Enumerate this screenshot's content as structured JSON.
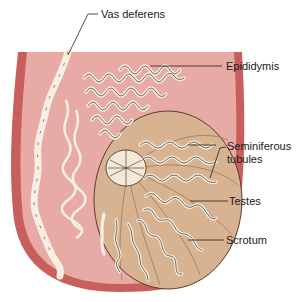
{
  "diagram": {
    "labels": [
      {
        "id": "vas_deferens",
        "text": "Vas deferens"
      },
      {
        "id": "epididymis",
        "text": "Epididymis"
      },
      {
        "id": "seminiferous_line1",
        "text": "Seminiferous"
      },
      {
        "id": "seminiferous_line2",
        "text": "tubules"
      },
      {
        "id": "testes",
        "text": "Testes"
      },
      {
        "id": "scrotum",
        "text": "Scrotum"
      }
    ],
    "colors": {
      "scrotum_wall": "#c85f5c",
      "scrotum_inner": "#e8aaa5",
      "testis_fill": "#d8b391",
      "testis_outline": "#5a3a2a",
      "tubule_fill": "#f6efe2",
      "tubule_outline": "#3b2a22",
      "leader_line": "#222222",
      "background": "#ffffff"
    }
  }
}
